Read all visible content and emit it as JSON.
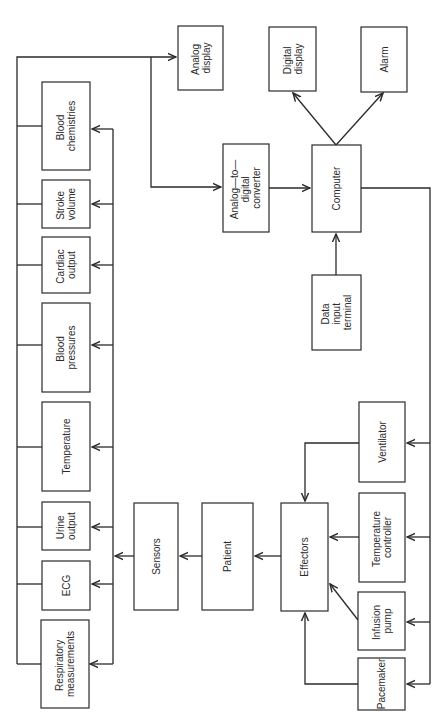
{
  "diagram": {
    "orientation": "rotated-90-ccw",
    "nodes": {
      "analog_display": [
        "Analog",
        "display"
      ],
      "digital_display": [
        "Digital",
        "display"
      ],
      "alarm": [
        "Alarm"
      ],
      "ad_converter": [
        "Analog—to—",
        "digital",
        "converter"
      ],
      "computer": [
        "Computer"
      ],
      "data_input_terminal": [
        "Data",
        "input",
        "terminal"
      ],
      "blood_chemistries": [
        "Blood",
        "chemistries"
      ],
      "stroke_volume": [
        "Stroke",
        "volume"
      ],
      "cardiac_output": [
        "Cardiac",
        "output"
      ],
      "blood_pressures": [
        "Blood",
        "pressures"
      ],
      "temperature": [
        "Temperature"
      ],
      "urine_output": [
        "Urine",
        "output"
      ],
      "ecg": [
        "ECG"
      ],
      "respiratory_measurements": [
        "Respiratory",
        "measurements"
      ],
      "sensors": [
        "Sensors"
      ],
      "patient": [
        "Patient"
      ],
      "effectors": [
        "Effectors"
      ],
      "ventilator": [
        "Ventilator"
      ],
      "temperature_controller": [
        "Temperature",
        "controller"
      ],
      "infusion_pump": [
        "Infusion",
        "pump"
      ],
      "pacemaker": [
        "Pacemaker"
      ]
    },
    "edges": [
      [
        "measurements_bus",
        "analog_display"
      ],
      [
        "measurements_bus",
        "ad_converter"
      ],
      [
        "ad_converter",
        "computer"
      ],
      [
        "data_input_terminal",
        "computer"
      ],
      [
        "computer",
        "digital_display"
      ],
      [
        "computer",
        "alarm"
      ],
      [
        "computer",
        "ventilator"
      ],
      [
        "computer",
        "temperature_controller"
      ],
      [
        "computer",
        "infusion_pump"
      ],
      [
        "computer",
        "pacemaker"
      ],
      [
        "ventilator",
        "effectors"
      ],
      [
        "temperature_controller",
        "effectors"
      ],
      [
        "infusion_pump",
        "effectors"
      ],
      [
        "pacemaker",
        "effectors"
      ],
      [
        "effectors",
        "patient"
      ],
      [
        "patient",
        "sensors"
      ],
      [
        "sensors",
        "blood_chemistries"
      ],
      [
        "sensors",
        "stroke_volume"
      ],
      [
        "sensors",
        "cardiac_output"
      ],
      [
        "sensors",
        "blood_pressures"
      ],
      [
        "sensors",
        "temperature"
      ],
      [
        "sensors",
        "urine_output"
      ],
      [
        "sensors",
        "ecg"
      ],
      [
        "sensors",
        "respiratory_measurements"
      ]
    ]
  }
}
